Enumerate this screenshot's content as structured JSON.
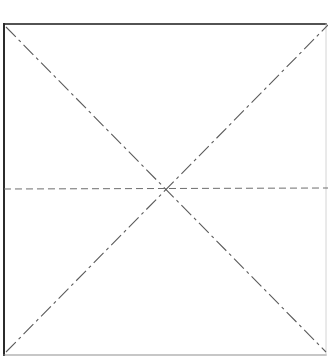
{
  "figure": {
    "title": "Rectangular frame with crossed dash-dot diagonals and dashed horizontal centerline",
    "kind": "line-drawing",
    "background_color": "#ffffff",
    "canvas": {
      "width": 328,
      "height": 361
    }
  },
  "frame": {
    "name": "outer-rectangle",
    "left": 4,
    "top": 24,
    "right": 326,
    "bottom": 355,
    "right_edge_cropped": true,
    "borders": {
      "top": {
        "color": "#1a1a1a",
        "width": 1.6,
        "style": "solid"
      },
      "left": {
        "color": "#2b2b2b",
        "width": 2.0,
        "style": "solid"
      },
      "bottom": {
        "color": "#8f8f8f",
        "width": 1.2,
        "style": "solid"
      },
      "right": {
        "color": "#c9c9c9",
        "width": 0.8,
        "style": "solid"
      }
    }
  },
  "center_point": {
    "name": "diagonal-intersection",
    "x": 168,
    "y": 189
  },
  "lines": [
    {
      "name": "diagonal-top-left-to-bottom-right",
      "style": "dash-dot",
      "color": "#5a5a5a",
      "width": 1.1,
      "dash_pattern": "14 4 3 4",
      "x1": 6,
      "y1": 27,
      "x2": 326,
      "y2": 352
    },
    {
      "name": "diagonal-bottom-left-to-top-right",
      "style": "dash-dot",
      "color": "#5a5a5a",
      "width": 1.1,
      "dash_pattern": "14 4 3 4",
      "x1": 6,
      "y1": 352,
      "x2": 328,
      "y2": 25
    },
    {
      "name": "horizontal-centerline",
      "style": "dashed",
      "color": "#6e6e6e",
      "width": 1.0,
      "dash_pattern": "7 4",
      "x1": 4,
      "y1": 189,
      "x2": 328,
      "y2": 188
    }
  ],
  "labels": {
    "caption": "",
    "figure_number": ""
  }
}
